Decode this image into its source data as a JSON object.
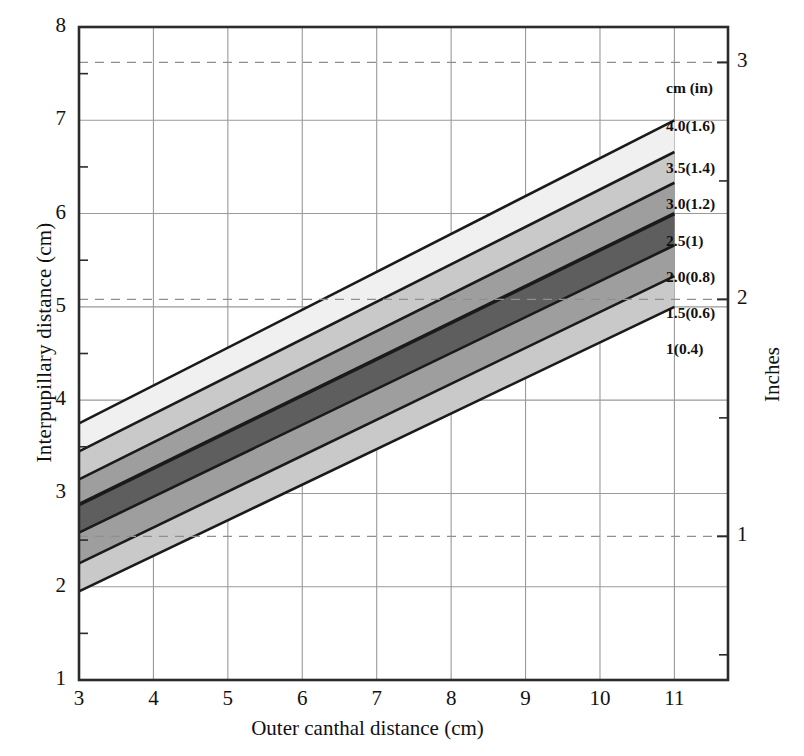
{
  "chart_data": {
    "type": "area",
    "title": "",
    "xlabel": "Outer canthal distance (cm)",
    "ylabel": "Interpupillary distance (cm)",
    "y2label": "Inches",
    "xlim": [
      3,
      11.72
    ],
    "ylim": [
      1,
      8
    ],
    "y2lim_in": [
      0.3937,
      3.1496
    ],
    "xticks": [
      3,
      4,
      5,
      6,
      7,
      8,
      9,
      10,
      11
    ],
    "xticklabels": [
      "3",
      "4",
      "5",
      "6",
      "7",
      "8",
      "9",
      "10",
      "11"
    ],
    "yticks": [
      1,
      2,
      3,
      4,
      5,
      6,
      7,
      8
    ],
    "yticklabels": [
      "1",
      "2",
      "3",
      "4",
      "5",
      "6",
      "7",
      "8"
    ],
    "yminorticks": [
      1.5,
      2.5,
      3.5,
      4.5,
      5.5,
      6.5,
      7.5
    ],
    "y2ticks_cm": [
      2.54,
      5.08,
      7.62
    ],
    "y2ticklabels": [
      "1",
      "2",
      "3"
    ],
    "y2minorticks_cm": [
      1.27,
      3.81,
      6.35
    ],
    "grid": "major-x-and-y-solid; inches-dashed",
    "band_x_range": [
      3,
      11
    ],
    "series": [
      {
        "name": "1 (0.4)",
        "legend_label": "1(0.4)",
        "shade": "#f0f0f0",
        "x": [
          3,
          11
        ],
        "y": [
          1.95,
          5.0
        ]
      },
      {
        "name": "1.5 (0.6)",
        "legend_label": "1.5(0.6)",
        "shade": "#c9c9c9",
        "x": [
          3,
          11
        ],
        "y": [
          2.25,
          5.33
        ]
      },
      {
        "name": "2.0 (0.8)",
        "legend_label": "2.0(0.8)",
        "shade": "#9e9e9e",
        "x": [
          3,
          11
        ],
        "y": [
          2.58,
          5.66
        ]
      },
      {
        "name": "2.5 (1)",
        "legend_label": "2.5(1)",
        "shade": "#5e5e5e",
        "x": [
          3,
          11
        ],
        "y": [
          2.88,
          6.0
        ]
      },
      {
        "name": "3.0 (1.2)",
        "legend_label": "3.0(1.2)",
        "shade": "#9e9e9e",
        "x": [
          3,
          11
        ],
        "y": [
          3.15,
          6.33
        ]
      },
      {
        "name": "3.5 (1.4)",
        "legend_label": "3.5(1.4)",
        "shade": "#c9c9c9",
        "x": [
          3,
          11
        ],
        "y": [
          3.45,
          6.66
        ]
      },
      {
        "name": "4.0 (1.6)",
        "legend_label": "4.0(1.6)",
        "shade": "#f0f0f0",
        "x": [
          3,
          11
        ],
        "y": [
          3.75,
          7.0
        ]
      }
    ],
    "band_top_boundary": {
      "x": [
        3,
        11
      ],
      "y": [
        3.75,
        7.0
      ]
    },
    "band_bottom_boundary": {
      "x": [
        3,
        11
      ],
      "y": [
        1.95,
        5.0
      ]
    },
    "legend_header": "cm (in)",
    "legend_entries": [
      "4.0(1.6)",
      "3.5(1.4)",
      "3.0(1.2)",
      "2.5(1)",
      "2.0(0.8)",
      "1.5(0.6)",
      "1(0.4)"
    ]
  },
  "colors": {
    "axis": "#2b2b2b",
    "grid": "#9a9a9a",
    "dashed_grid": "#8f8f8f",
    "band_line": "#1a1a1a",
    "text": "#111111",
    "background": "#ffffff"
  }
}
